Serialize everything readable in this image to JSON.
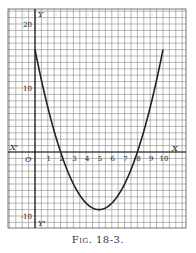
{
  "figure": {
    "caption": "Fig. 18-3."
  },
  "chart_data": {
    "type": "line",
    "title": "",
    "equation": "y = x^2 - 10x + 16",
    "xlabel": "X",
    "xlabel_neg": "X'",
    "ylabel": "Y",
    "ylabel_neg": "Y'",
    "origin_label": "O",
    "xlim": [
      -0.75,
      11.0
    ],
    "ylim": [
      -12,
      20.5
    ],
    "x_ticks": [
      1,
      2,
      3,
      4,
      5,
      6,
      7,
      8,
      9,
      10
    ],
    "y_ticks": [
      20,
      10,
      -10
    ],
    "grid": true,
    "series": [
      {
        "name": "parabola",
        "x": [
          0,
          1,
          2,
          3,
          4,
          5,
          6,
          7,
          8,
          9,
          10
        ],
        "y": [
          16,
          7,
          0,
          -5,
          -8,
          -9,
          -8,
          -5,
          0,
          7,
          16
        ]
      }
    ],
    "roots": [
      2,
      8
    ],
    "minimum": {
      "x": 5,
      "y": -9
    }
  }
}
